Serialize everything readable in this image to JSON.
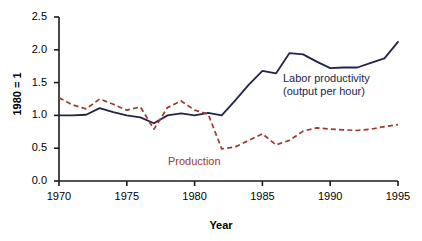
{
  "chart_data": {
    "type": "line",
    "title": "",
    "xlabel": "Year",
    "ylabel": "1980 = 1",
    "xlim": [
      1970,
      1995
    ],
    "ylim": [
      0.0,
      2.5
    ],
    "grid": false,
    "legend_position": "inline-annotation",
    "xticks": [
      "1970",
      "1975",
      "1980",
      "1985",
      "1990",
      "1995"
    ],
    "xtick_values": [
      1970,
      1975,
      1980,
      1985,
      1990,
      1995
    ],
    "yticks": [
      "0.0",
      "0.5",
      "1.0",
      "1.5",
      "2.0",
      "2.5"
    ],
    "ytick_values": [
      0.0,
      0.5,
      1.0,
      1.5,
      2.0,
      2.5
    ],
    "x": [
      1970,
      1971,
      1972,
      1973,
      1974,
      1975,
      1976,
      1977,
      1978,
      1979,
      1980,
      1981,
      1982,
      1983,
      1984,
      1985,
      1986,
      1987,
      1988,
      1989,
      1990,
      1991,
      1992,
      1993,
      1994,
      1995
    ],
    "series": [
      {
        "name": "Labor productivity (output per hour)",
        "style": "solid",
        "color": "#23244a",
        "values": [
          1.0,
          1.0,
          1.01,
          1.11,
          1.05,
          1.0,
          0.97,
          0.88,
          1.0,
          1.03,
          1.0,
          1.04,
          1.0,
          1.23,
          1.47,
          1.68,
          1.64,
          1.95,
          1.93,
          1.82,
          1.72,
          1.73,
          1.73,
          1.8,
          1.87,
          2.12
        ]
      },
      {
        "name": "Production",
        "style": "dashed",
        "color": "#a0392c",
        "values": [
          1.27,
          1.16,
          1.1,
          1.25,
          1.17,
          1.08,
          1.13,
          0.79,
          1.12,
          1.22,
          1.08,
          1.02,
          0.49,
          0.52,
          0.62,
          0.72,
          0.55,
          0.62,
          0.76,
          0.81,
          0.79,
          0.78,
          0.77,
          0.79,
          0.83,
          0.86
        ]
      }
    ],
    "annotations": [
      {
        "text_line1": "Labor productivity",
        "text_line2": "(output per hour)",
        "color": "#23244a"
      },
      {
        "text": "Production",
        "color": "#a0392c"
      }
    ]
  }
}
